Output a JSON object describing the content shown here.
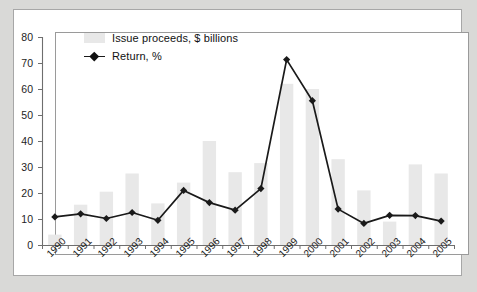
{
  "chart_data": {
    "type": "bar",
    "title": "",
    "subtitle": "",
    "xlabel": "",
    "ylabel": "",
    "ylim": [
      0,
      80
    ],
    "yticks": [
      0,
      10,
      20,
      30,
      40,
      50,
      60,
      70,
      80
    ],
    "grid": false,
    "legend_position": "top-left",
    "categories": [
      "1990",
      "1991",
      "1992",
      "1993",
      "1994",
      "1995",
      "1996",
      "1997",
      "1998",
      "1999",
      "2000",
      "2001",
      "2002",
      "2003",
      "2004",
      "2005"
    ],
    "series": [
      {
        "name": "Issue proceeds, $ billions",
        "type": "bar",
        "color": "#e8e8e8",
        "values": [
          4,
          15.5,
          20.5,
          27.5,
          16,
          24,
          40,
          28,
          31.5,
          62,
          60,
          33,
          21,
          9,
          31,
          27.5
        ]
      },
      {
        "name": "Return, %",
        "type": "line",
        "color": "#1a1a1a",
        "marker": "diamond",
        "values": [
          10.8,
          12,
          10.2,
          12.5,
          9.5,
          21,
          16.3,
          13.4,
          21.7,
          71.3,
          55.5,
          13.8,
          8.3,
          11.4,
          11.3,
          9.2
        ]
      }
    ]
  },
  "legend": {
    "items": [
      {
        "label": "Issue proceeds, $ billions",
        "marker": "bar-swatch"
      },
      {
        "label": "Return, %",
        "marker": "line-diamond"
      }
    ]
  },
  "colors": {
    "page_background": "#d9d9d7",
    "card_background": "#ffffff",
    "card_border": "#a7a7a7",
    "frame_border": "#9a9a9a",
    "bar_fill": "#e8e8e8",
    "line_stroke": "#1a1a1a",
    "axis_text": "#1d1d1d"
  }
}
